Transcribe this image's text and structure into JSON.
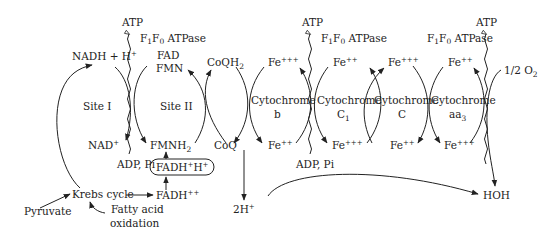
{
  "diagram": {
    "atp_synthase": {
      "product": "ATP",
      "enzyme_label": "F",
      "enzyme_sub1": "1",
      "enzyme_mid": "F",
      "enzyme_sub0": "0",
      "enzyme_suffix": " ATPase",
      "substrate": "ADP, Pi"
    },
    "site1": {
      "label": "Site I",
      "top": "NADH + H",
      "top_sup": "+",
      "bottom": "NAD",
      "bottom_sup": "+"
    },
    "site2": {
      "label": "Site II",
      "top1": "FAD",
      "top2": "FMN",
      "bottom": "FMNH",
      "bottom_sub": "2"
    },
    "coq": {
      "top": "CoQH",
      "top_sub": "2",
      "bottom": "CoQ"
    },
    "fadh_box": {
      "label": "FADH",
      "sup1": "+",
      "mid": "H",
      "sup2": "+"
    },
    "fadh2": {
      "label": "FADH",
      "sup": "++"
    },
    "cytochromes": [
      {
        "name": "Cytochrome",
        "sub": "b",
        "sub_idx": "",
        "top": "Fe",
        "top_sup": "+++",
        "bottom": "Fe",
        "bottom_sup": "++"
      },
      {
        "name": "Cytochrome",
        "sub": "C",
        "sub_idx": "1",
        "top": "Fe",
        "top_sup": "++",
        "bottom": "Fe",
        "bottom_sup": "+++"
      },
      {
        "name": "Cytochrome",
        "sub": "C",
        "sub_idx": "",
        "top": "Fe",
        "top_sup": "+++",
        "bottom": "Fe",
        "bottom_sup": "++"
      },
      {
        "name": "Cytochrome",
        "sub": "aa",
        "sub_idx": "3",
        "top": "Fe",
        "top_sup": "++",
        "bottom": "Fe",
        "bottom_sup": "+++"
      }
    ],
    "oxygen": {
      "label": "1/2 O",
      "sub": "2"
    },
    "water": "HOH",
    "protons": {
      "label": "2H",
      "sup": "+"
    },
    "krebs": "Krebs cycle",
    "pyruvate": "Pyruvate",
    "fatty_acid_1": "Fatty acid",
    "fatty_acid_2": "oxidation"
  }
}
